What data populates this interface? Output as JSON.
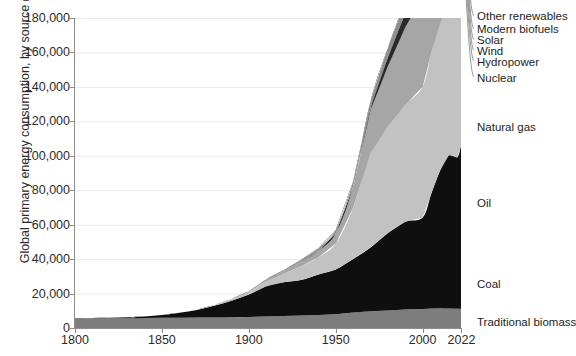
{
  "chart_data": {
    "type": "area",
    "title": "",
    "xlabel": "",
    "ylabel": "Global primary energy consumption, by source (TWh)",
    "xlim": [
      1800,
      2022
    ],
    "ylim": [
      0,
      180000
    ],
    "grid": true,
    "stacked": true,
    "legend_position": "right-inline-labels",
    "xticks": [
      "1800",
      "1850",
      "1900",
      "1950",
      "2000",
      "2022"
    ],
    "xtick_values": [
      1800,
      1850,
      1900,
      1950,
      2000,
      2022
    ],
    "yticks": [
      "0",
      "20,000",
      "40,000",
      "60,000",
      "80,000",
      "100,000",
      "120,000",
      "140,000",
      "160,000",
      "180,000"
    ],
    "ytick_values": [
      0,
      20000,
      40000,
      60000,
      80000,
      100000,
      120000,
      140000,
      160000,
      180000
    ],
    "x": [
      1800,
      1810,
      1820,
      1830,
      1840,
      1850,
      1860,
      1870,
      1880,
      1890,
      1900,
      1910,
      1920,
      1930,
      1940,
      1950,
      1960,
      1970,
      1980,
      1990,
      2000,
      2005,
      2010,
      2015,
      2020,
      2022
    ],
    "series": [
      {
        "name": "Traditional biomass",
        "color": "#7d7d7d",
        "values": [
          5556,
          5610,
          5670,
          5730,
          5800,
          5880,
          5970,
          6060,
          6160,
          6270,
          6400,
          6700,
          7000,
          7300,
          7600,
          8000,
          9000,
          9700,
          10200,
          10700,
          11100,
          11300,
          11400,
          11300,
          11200,
          11111
        ]
      },
      {
        "name": "Coal",
        "color": "#0f0f0f",
        "values": [
          97,
          180,
          300,
          500,
          900,
          1700,
          2900,
          4400,
          6700,
          9600,
          13000,
          17500,
          19500,
          20500,
          23500,
          26000,
          31000,
          37000,
          45000,
          51000,
          53000,
          67000,
          80000,
          89000,
          88000,
          95000
        ]
      },
      {
        "name": "Oil",
        "color": "#c2c2c2",
        "values": [
          0,
          0,
          0,
          0,
          0,
          0,
          20,
          100,
          300,
          800,
          1500,
          3000,
          5000,
          8000,
          10000,
          15000,
          30000,
          55000,
          62000,
          68000,
          76000,
          82000,
          85000,
          90000,
          86000,
          94000
        ]
      },
      {
        "name": "Natural gas",
        "color": "#a6a6a6",
        "values": [
          0,
          0,
          0,
          0,
          0,
          0,
          0,
          20,
          70,
          180,
          350,
          700,
          1500,
          2600,
          3600,
          6000,
          12000,
          25000,
          35000,
          45000,
          52000,
          57000,
          63000,
          68000,
          72000,
          75000
        ]
      },
      {
        "name": "Nuclear",
        "color": "#2a2a2a",
        "values": [
          0,
          0,
          0,
          0,
          0,
          0,
          0,
          0,
          0,
          0,
          0,
          0,
          0,
          0,
          0,
          0,
          200,
          1000,
          5000,
          8000,
          9000,
          9300,
          9000,
          8400,
          8900,
          8900
        ]
      },
      {
        "name": "Hydropower",
        "color": "#8f8f8f",
        "values": [
          0,
          0,
          0,
          0,
          0,
          0,
          0,
          0,
          0,
          50,
          150,
          400,
          700,
          1200,
          1600,
          2000,
          3000,
          4000,
          5500,
          6500,
          7300,
          7900,
          8900,
          9800,
          10500,
          11000
        ]
      },
      {
        "name": "Wind",
        "color": "#4a4a4a",
        "values": [
          0,
          0,
          0,
          0,
          0,
          0,
          0,
          0,
          0,
          0,
          0,
          0,
          0,
          0,
          0,
          0,
          0,
          0,
          0,
          10,
          80,
          250,
          900,
          2200,
          4100,
          5100
        ]
      },
      {
        "name": "Solar",
        "color": "#b5b5b5",
        "values": [
          0,
          0,
          0,
          0,
          0,
          0,
          0,
          0,
          0,
          0,
          0,
          0,
          0,
          0,
          0,
          0,
          0,
          0,
          0,
          1,
          5,
          20,
          200,
          1000,
          2700,
          3700
        ]
      },
      {
        "name": "Modern biofuels",
        "color": "#6b6b6b",
        "values": [
          0,
          0,
          0,
          0,
          0,
          0,
          0,
          0,
          0,
          0,
          0,
          0,
          0,
          0,
          0,
          0,
          0,
          0,
          20,
          90,
          250,
          500,
          900,
          1100,
          1100,
          1200
        ]
      },
      {
        "name": "Other renewables",
        "color": "#d8d8d8",
        "values": [
          0,
          0,
          0,
          0,
          0,
          0,
          0,
          0,
          0,
          0,
          0,
          0,
          0,
          0,
          0,
          0,
          0,
          20,
          60,
          150,
          350,
          600,
          900,
          1400,
          1900,
          2100
        ]
      }
    ],
    "annotations": [
      {
        "text": "Other renewables",
        "series": "Other renewables"
      },
      {
        "text": "Modern biofuels",
        "series": "Modern biofuels"
      },
      {
        "text": "Solar",
        "series": "Solar"
      },
      {
        "text": "Wind",
        "series": "Wind"
      },
      {
        "text": "Hydropower",
        "series": "Hydropower"
      },
      {
        "text": "Nuclear",
        "series": "Nuclear"
      },
      {
        "text": "Natural gas",
        "series": "Natural gas"
      },
      {
        "text": "Oil",
        "series": "Oil"
      },
      {
        "text": "Coal",
        "series": "Coal"
      },
      {
        "text": "Traditional biomass",
        "series": "Traditional biomass"
      }
    ]
  },
  "legend_labels": {
    "other_renewables": "Other renewables",
    "modern_biofuels": "Modern biofuels",
    "solar": "Solar",
    "wind": "Wind",
    "hydropower": "Hydropower",
    "nuclear": "Nuclear",
    "natural_gas": "Natural gas",
    "oil": "Oil",
    "coal": "Coal",
    "traditional_biomass": "Traditional biomass"
  },
  "axis": {
    "y_title": "Global primary energy consumption, by source (TWh)",
    "y_ticks": [
      "180,000",
      "160,000",
      "140,000",
      "120,000",
      "100,000",
      "80,000",
      "60,000",
      "40,000",
      "20,000",
      "0"
    ],
    "x_ticks": [
      "1800",
      "1850",
      "1900",
      "1950",
      "2000",
      "2022"
    ]
  },
  "colors": {
    "background": "#ffffff",
    "grid": "#eaeaea",
    "axis": "#8d8d8d",
    "text": "#1d1d1d"
  }
}
